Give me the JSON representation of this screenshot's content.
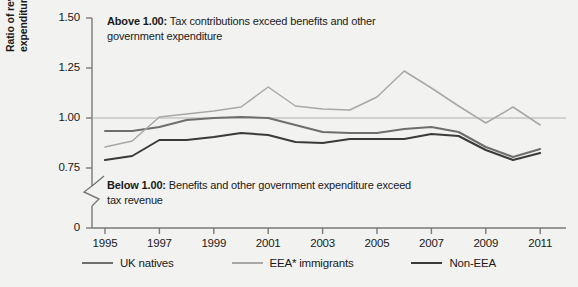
{
  "chart_data": {
    "type": "line",
    "title": "",
    "xlabel": "",
    "ylabel": "Ratio of revenue to expenditure",
    "ylabel_line1": "Ratio of revenue to",
    "ylabel_line2": "expenditure",
    "x": [
      1995,
      1996,
      1997,
      1998,
      1999,
      2000,
      2001,
      2002,
      2003,
      2004,
      2005,
      2006,
      2007,
      2008,
      2009,
      2010,
      2011
    ],
    "xlim": [
      1994.4,
      2011.6
    ],
    "ylim": [
      0.75,
      1.5
    ],
    "y_axis_break": true,
    "y_ticks": [
      "1.50",
      "1.25",
      "1.00",
      "0.75",
      "0"
    ],
    "y_tick_values": [
      1.5,
      1.25,
      1.0,
      0.75,
      0
    ],
    "x_ticks": [
      "1995",
      "1997",
      "1999",
      "2001",
      "2003",
      "2005",
      "2007",
      "2009",
      "2011"
    ],
    "x_tick_values": [
      1995,
      1997,
      1999,
      2001,
      2003,
      2005,
      2007,
      2009,
      2011
    ],
    "grid": false,
    "reference_line": 1.0,
    "legend_position": "bottom",
    "series": [
      {
        "name": "UK natives",
        "color": "#6e6e6e",
        "values": [
          0.935,
          0.935,
          0.955,
          0.99,
          1.0,
          1.005,
          1.0,
          0.965,
          0.93,
          0.925,
          0.925,
          0.945,
          0.955,
          0.93,
          0.855,
          0.805,
          0.845
        ]
      },
      {
        "name": "EEA* immigrants",
        "color": "#a8a8a8",
        "values": [
          0.855,
          0.885,
          1.005,
          1.02,
          1.035,
          1.055,
          1.155,
          1.06,
          1.045,
          1.04,
          1.105,
          1.235,
          1.15,
          1.06,
          0.975,
          1.055,
          0.965
        ]
      },
      {
        "name": "Non-EEA",
        "color": "#3a3a3a",
        "values": [
          0.79,
          0.81,
          0.89,
          0.89,
          0.905,
          0.925,
          0.915,
          0.88,
          0.875,
          0.895,
          0.895,
          0.895,
          0.92,
          0.91,
          0.84,
          0.79,
          0.825
        ]
      }
    ],
    "annotations": [
      {
        "id": "above-one",
        "bold": "Above 1.00:",
        "line1": "Tax contributions exceed benefits and other",
        "line2": "government expenditure"
      },
      {
        "id": "below-one",
        "bold": "Below 1.00:",
        "line1": "Benefits and other government expenditure exceed",
        "line2": "tax revenue"
      }
    ]
  },
  "legend": {
    "items": [
      {
        "label": "UK natives",
        "color": "#6e6e6e",
        "swatch": "line-swatch"
      },
      {
        "label": "EEA* immigrants",
        "color": "#a8a8a8",
        "swatch": "line-swatch"
      },
      {
        "label": "Non-EEA",
        "color": "#3a3a3a",
        "swatch": "line-swatch"
      }
    ]
  },
  "axis": {
    "y_title_line1": "Ratio of revenue to",
    "y_title_line2": "expenditure"
  }
}
